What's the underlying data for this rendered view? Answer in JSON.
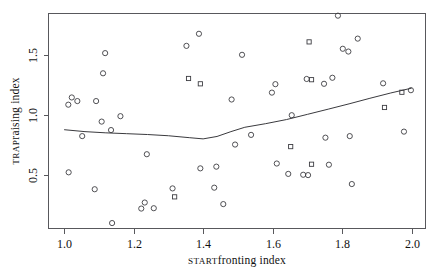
{
  "chart_data": {
    "type": "scatter",
    "title": "",
    "xlabel": "START fronting index",
    "ylabel": "TRAP raising index",
    "xlabel_smallcaps": "START",
    "xlabel_rest": " fronting index",
    "ylabel_smallcaps": "TRAP",
    "ylabel_rest": " raising index",
    "xlim": [
      0.955,
      2.04
    ],
    "ylim": [
      0.06,
      1.84
    ],
    "grid": false,
    "legend": "none",
    "xticks": [
      1.0,
      1.2,
      1.4,
      1.6,
      1.8,
      2.0
    ],
    "xtick_labels": [
      "1.0",
      "1.2",
      "1.4",
      "1.6",
      "1.8",
      "2.0"
    ],
    "yticks": [
      0.5,
      1.0,
      1.5
    ],
    "ytick_labels": [
      "0.5",
      "1.0",
      "1.5"
    ],
    "marker_shapes": [
      "circle",
      "square"
    ],
    "marker_color": "#3d3d42",
    "line_color": "#3a3a3e",
    "points": [
      {
        "x": 1.012,
        "y": 1.085,
        "m": "circle"
      },
      {
        "x": 1.022,
        "y": 1.145,
        "m": "circle"
      },
      {
        "x": 1.013,
        "y": 0.525,
        "m": "circle"
      },
      {
        "x": 1.038,
        "y": 1.115,
        "m": "circle"
      },
      {
        "x": 1.052,
        "y": 0.825,
        "m": "circle"
      },
      {
        "x": 1.088,
        "y": 0.385,
        "m": "circle"
      },
      {
        "x": 1.092,
        "y": 1.115,
        "m": "circle"
      },
      {
        "x": 1.108,
        "y": 0.945,
        "m": "circle"
      },
      {
        "x": 1.118,
        "y": 1.512,
        "m": "circle"
      },
      {
        "x": 1.112,
        "y": 1.345,
        "m": "circle"
      },
      {
        "x": 1.135,
        "y": 0.875,
        "m": "circle"
      },
      {
        "x": 1.138,
        "y": 0.105,
        "m": "circle"
      },
      {
        "x": 1.162,
        "y": 0.99,
        "m": "circle"
      },
      {
        "x": 1.222,
        "y": 0.225,
        "m": "circle"
      },
      {
        "x": 1.232,
        "y": 0.275,
        "m": "circle"
      },
      {
        "x": 1.238,
        "y": 0.675,
        "m": "circle"
      },
      {
        "x": 1.258,
        "y": 0.228,
        "m": "circle"
      },
      {
        "x": 1.312,
        "y": 0.392,
        "m": "circle"
      },
      {
        "x": 1.318,
        "y": 0.322,
        "m": "square"
      },
      {
        "x": 1.352,
        "y": 1.572,
        "m": "circle"
      },
      {
        "x": 1.358,
        "y": 1.302,
        "m": "square"
      },
      {
        "x": 1.388,
        "y": 1.672,
        "m": "circle"
      },
      {
        "x": 1.392,
        "y": 1.258,
        "m": "square"
      },
      {
        "x": 1.392,
        "y": 0.558,
        "m": "circle"
      },
      {
        "x": 1.432,
        "y": 0.398,
        "m": "circle"
      },
      {
        "x": 1.438,
        "y": 0.572,
        "m": "circle"
      },
      {
        "x": 1.458,
        "y": 0.262,
        "m": "circle"
      },
      {
        "x": 1.482,
        "y": 1.128,
        "m": "circle"
      },
      {
        "x": 1.492,
        "y": 0.755,
        "m": "circle"
      },
      {
        "x": 1.512,
        "y": 1.498,
        "m": "circle"
      },
      {
        "x": 1.538,
        "y": 0.835,
        "m": "circle"
      },
      {
        "x": 1.598,
        "y": 1.185,
        "m": "circle"
      },
      {
        "x": 1.608,
        "y": 1.255,
        "m": "circle"
      },
      {
        "x": 1.612,
        "y": 0.598,
        "m": "circle"
      },
      {
        "x": 1.645,
        "y": 0.512,
        "m": "circle"
      },
      {
        "x": 1.652,
        "y": 0.738,
        "m": "square"
      },
      {
        "x": 1.655,
        "y": 0.998,
        "m": "circle"
      },
      {
        "x": 1.688,
        "y": 0.505,
        "m": "circle"
      },
      {
        "x": 1.702,
        "y": 0.502,
        "m": "circle"
      },
      {
        "x": 1.698,
        "y": 1.298,
        "m": "circle"
      },
      {
        "x": 1.712,
        "y": 1.292,
        "m": "square"
      },
      {
        "x": 1.712,
        "y": 0.592,
        "m": "square"
      },
      {
        "x": 1.705,
        "y": 1.605,
        "m": "square"
      },
      {
        "x": 1.748,
        "y": 1.258,
        "m": "circle"
      },
      {
        "x": 1.752,
        "y": 0.812,
        "m": "circle"
      },
      {
        "x": 1.762,
        "y": 0.588,
        "m": "circle"
      },
      {
        "x": 1.772,
        "y": 1.308,
        "m": "circle"
      },
      {
        "x": 1.788,
        "y": 1.822,
        "m": "circle"
      },
      {
        "x": 1.802,
        "y": 1.548,
        "m": "circle"
      },
      {
        "x": 1.818,
        "y": 1.525,
        "m": "circle"
      },
      {
        "x": 1.822,
        "y": 0.825,
        "m": "circle"
      },
      {
        "x": 1.828,
        "y": 0.428,
        "m": "circle"
      },
      {
        "x": 1.845,
        "y": 1.632,
        "m": "circle"
      },
      {
        "x": 1.918,
        "y": 1.262,
        "m": "circle"
      },
      {
        "x": 1.922,
        "y": 1.062,
        "m": "square"
      },
      {
        "x": 1.972,
        "y": 1.188,
        "m": "square"
      },
      {
        "x": 1.978,
        "y": 0.862,
        "m": "circle"
      },
      {
        "x": 1.998,
        "y": 1.205,
        "m": "circle"
      }
    ],
    "smooth_line": {
      "name": "loess smoother",
      "x": [
        1.0,
        1.06,
        1.12,
        1.18,
        1.24,
        1.3,
        1.36,
        1.4,
        1.44,
        1.48,
        1.52,
        1.58,
        1.64,
        1.7,
        1.76,
        1.82,
        1.88,
        1.94,
        2.0
      ],
      "y": [
        0.878,
        0.862,
        0.852,
        0.845,
        0.838,
        0.828,
        0.812,
        0.802,
        0.822,
        0.862,
        0.898,
        0.928,
        0.962,
        1.005,
        1.048,
        1.092,
        1.138,
        1.182,
        1.222
      ]
    }
  }
}
